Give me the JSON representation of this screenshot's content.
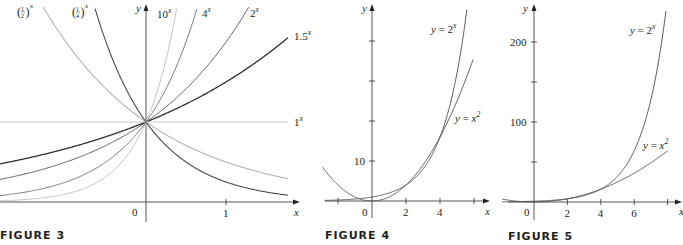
{
  "chart_data": [
    {
      "type": "line",
      "id": "figure-3",
      "caption": "FIGURE 3",
      "xlabel": "x",
      "ylabel": "y",
      "xlim": [
        -1.825,
        1.9
      ],
      "ylim": [
        0,
        2.45
      ],
      "x_ticks": [
        {
          "value": 0,
          "label": "0"
        },
        {
          "value": 1,
          "label": "1"
        }
      ],
      "y_ticks": [],
      "series": [
        {
          "name": "(1/2)^x",
          "base": 0.5,
          "label_main": "1/2",
          "label_exp": "x",
          "color": "#b5b5b5",
          "width": 1.1
        },
        {
          "name": "(1/4)^x",
          "base": 0.25,
          "label_main": "1/4",
          "label_exp": "x",
          "color": "#4a4a4a",
          "width": 1.1
        },
        {
          "name": "10^x",
          "base": 10,
          "label_main": "10",
          "label_exp": "x",
          "color": "#c4c4c4",
          "width": 1.0
        },
        {
          "name": "4^x",
          "base": 4,
          "label_main": "4",
          "label_exp": "x",
          "color": "#7a7a7a",
          "width": 1.0
        },
        {
          "name": "2^x",
          "base": 2,
          "label_main": "2",
          "label_exp": "x",
          "color": "#5e5e5e",
          "width": 1.0
        },
        {
          "name": "1.5^x",
          "base": 1.5,
          "label_main": "1.5",
          "label_exp": "x",
          "color": "#2e2e2e",
          "width": 1.3
        },
        {
          "name": "1^x",
          "base": 1,
          "label_main": "1",
          "label_exp": "x",
          "color": "#c8c8c8",
          "width": 1.0
        }
      ]
    },
    {
      "type": "line",
      "id": "figure-4",
      "caption": "FIGURE 4",
      "xlabel": "x",
      "ylabel": "y",
      "xlim": [
        -2.8,
        7.5
      ],
      "ylim": [
        -1.5,
        47
      ],
      "x_ticks": [
        {
          "value": -2,
          "label": ""
        },
        {
          "value": 0,
          "label": "0"
        },
        {
          "value": 2,
          "label": "2"
        },
        {
          "value": 4,
          "label": "4"
        },
        {
          "value": 6,
          "label": ""
        }
      ],
      "y_ticks": [
        {
          "value": 10,
          "label": "10"
        },
        {
          "value": 20,
          "label": ""
        },
        {
          "value": 30,
          "label": ""
        },
        {
          "value": 40,
          "label": ""
        }
      ],
      "series": [
        {
          "name": "y = 2^x",
          "func": "exp2",
          "x_range": [
            -2.8,
            5.58
          ],
          "label_main": "y = 2",
          "label_exp": "x",
          "color": "#4a4a4a"
        },
        {
          "name": "y = x^2",
          "func": "square",
          "x_range": [
            -2.9,
            5.95
          ],
          "label_main": "y = x",
          "label_exp": "2",
          "color": "#4a4a4a"
        }
      ]
    },
    {
      "type": "line",
      "id": "figure-5",
      "caption": "FIGURE 5",
      "xlabel": "x",
      "ylabel": "y",
      "xlim": [
        -2,
        8.5
      ],
      "ylim": [
        -10,
        250
      ],
      "x_ticks": [
        {
          "value": 0,
          "label": "0"
        },
        {
          "value": 2,
          "label": "2"
        },
        {
          "value": 4,
          "label": "4"
        },
        {
          "value": 6,
          "label": "6"
        },
        {
          "value": 8,
          "label": ""
        }
      ],
      "y_ticks": [
        {
          "value": 50,
          "label": ""
        },
        {
          "value": 100,
          "label": "100"
        },
        {
          "value": 150,
          "label": ""
        },
        {
          "value": 200,
          "label": "200"
        }
      ],
      "series": [
        {
          "name": "y = 2^x",
          "func": "exp2",
          "x_range": [
            -1.9,
            7.9
          ],
          "label_main": "y = 2",
          "label_exp": "x",
          "color": "#4a4a4a"
        },
        {
          "name": "y = x^2",
          "func": "square",
          "x_range": [
            -1.9,
            8.0
          ],
          "label_main": "y = x",
          "label_exp": "2",
          "color": "#4a4a4a"
        }
      ]
    }
  ],
  "captions": {
    "fig3": "FIGURE 3",
    "fig4": "FIGURE 4",
    "fig5": "FIGURE 5"
  }
}
